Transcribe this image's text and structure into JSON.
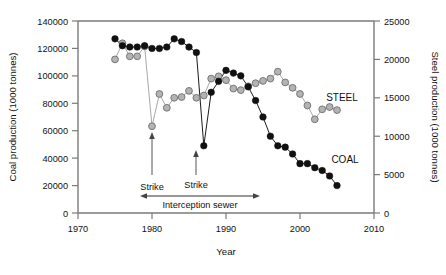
{
  "chart_data": {
    "type": "line",
    "title": "",
    "xlabel": "Year",
    "ylabel": "Coal production (1000 tonnes)",
    "y2label": "Steel production (1000 tonnes)",
    "xlim": [
      1970,
      2010
    ],
    "ylim": [
      0,
      140000
    ],
    "y2lim": [
      0,
      25000
    ],
    "xticks": [
      1970,
      1980,
      1990,
      2000,
      2010
    ],
    "xtick_labels": [
      "1970",
      "1980",
      "1990",
      "2000",
      "2010"
    ],
    "yticks": [
      0,
      20000,
      40000,
      60000,
      80000,
      100000,
      120000,
      140000
    ],
    "ytick_labels": [
      "0",
      "20000",
      "40000",
      "60000",
      "80000",
      "100000",
      "120000",
      "140000"
    ],
    "y2ticks": [
      0,
      5000,
      10000,
      15000,
      20000,
      25000
    ],
    "y2tick_labels": [
      "0",
      "5000",
      "10000",
      "15000",
      "20000",
      "25000"
    ],
    "grid": false,
    "legend_position": "inline-series-labels",
    "series": [
      {
        "name": "COAL",
        "axis": "left",
        "marker": "filled-circle",
        "color": "#111111",
        "x": [
          1975,
          1976,
          1977,
          1978,
          1979,
          1980,
          1981,
          1982,
          1983,
          1984,
          1985,
          1986,
          1987,
          1988,
          1989,
          1990,
          1991,
          1992,
          1993,
          1994,
          1995,
          1996,
          1997,
          1998,
          1999,
          2000,
          2001,
          2002,
          2003,
          2004,
          2005
        ],
        "y": [
          127000,
          122000,
          121000,
          121000,
          122000,
          120000,
          120000,
          121000,
          127000,
          125000,
          121000,
          117000,
          49000,
          88000,
          96000,
          104000,
          102000,
          100000,
          92000,
          82000,
          70000,
          56000,
          49000,
          48000,
          43000,
          36000,
          36000,
          33000,
          31000,
          27000,
          20000
        ],
        "note": "black filled circles, left axis, units 1000 tonnes"
      },
      {
        "name": "STEEL",
        "axis": "right",
        "marker": "grey-circle",
        "color": "#b3b3b3",
        "x": [
          1975,
          1976,
          1977,
          1978,
          1979,
          1980,
          1981,
          1982,
          1983,
          1984,
          1985,
          1986,
          1987,
          1988,
          1989,
          1990,
          1991,
          1992,
          1993,
          1994,
          1995,
          1996,
          1997,
          1998,
          1999,
          2000,
          2001,
          2002,
          2003,
          2004,
          2005
        ],
        "y": [
          20000,
          22100,
          20400,
          20400,
          21700,
          11300,
          15500,
          13700,
          15000,
          15100,
          15900,
          15000,
          15300,
          17500,
          17800,
          17300,
          16200,
          16000,
          16500,
          16900,
          17200,
          17500,
          18400,
          17000,
          16300,
          15500,
          14000,
          12200,
          13500,
          13800,
          13400
        ],
        "note": "grey circles, right axis, units 1000 tonnes"
      }
    ],
    "annotations": [
      {
        "name": "strike-1",
        "label": "Strike",
        "x": 1980,
        "arrow_to_y": 55000
      },
      {
        "name": "strike-2",
        "label": "Strike",
        "x": 1986,
        "arrow_to_y": 46000
      },
      {
        "name": "interception-sewer",
        "label": "Interception sewer",
        "x_start": 1979,
        "x_end": 1992,
        "y": 8000,
        "double_arrow": true
      }
    ],
    "series_labels": [
      {
        "name": "STEEL",
        "x": 2002,
        "y_right": 15200
      },
      {
        "name": "COAL",
        "x": 2003,
        "y_left": 30000
      }
    ]
  },
  "axes": {
    "left_title": "Coal production (1000 tonnes)",
    "right_title": "Steel production (1000 tonnes)",
    "x_title": "Year"
  },
  "labels": {
    "steel": "STEEL",
    "coal": "COAL",
    "strike_1": "Strike",
    "strike_2": "Strike",
    "interception_sewer": "Interception sewer"
  },
  "colors": {
    "coal_marker": "#111111",
    "steel_marker": "#b3b3b3",
    "steel_marker_edge": "#6e6e6e",
    "axis": "#7a7a7a",
    "background": "#ffffff"
  }
}
